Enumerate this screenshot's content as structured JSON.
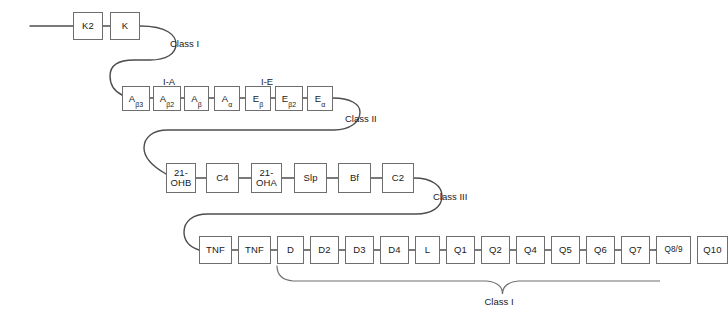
{
  "diagram": {
    "line_color": "#4d4d4d",
    "box_border_color": "#6e6e6e",
    "background": "#ffffff",
    "rows": [
      {
        "id": "row-1",
        "class_label": "Class I",
        "boxes": [
          {
            "id": "k2",
            "label": "K2"
          },
          {
            "id": "k",
            "label": "K"
          }
        ]
      },
      {
        "id": "row-2",
        "class_label": "Class II",
        "group_labels": [
          {
            "id": "i-a",
            "label": "I-A"
          },
          {
            "id": "i-e",
            "label": "I-E"
          }
        ],
        "boxes": [
          {
            "id": "a-beta3",
            "base": "A",
            "sub": "β3"
          },
          {
            "id": "a-beta2",
            "base": "A",
            "sub": "β2"
          },
          {
            "id": "a-beta",
            "base": "A",
            "sub": "β"
          },
          {
            "id": "a-alpha",
            "base": "A",
            "sub": "α"
          },
          {
            "id": "e-beta",
            "base": "E",
            "sub": "β"
          },
          {
            "id": "e-beta2",
            "base": "E",
            "sub": "β2"
          },
          {
            "id": "e-alpha",
            "base": "E",
            "sub": "α"
          }
        ]
      },
      {
        "id": "row-3",
        "class_label": "Class III",
        "boxes": [
          {
            "id": "21-ohb",
            "label": "21-\nOHB"
          },
          {
            "id": "c4",
            "label": "C4"
          },
          {
            "id": "21-oha",
            "label": "21-\nOHA"
          },
          {
            "id": "slp",
            "label": "Slp"
          },
          {
            "id": "bf",
            "label": "Bf"
          },
          {
            "id": "c2",
            "label": "C2"
          }
        ]
      },
      {
        "id": "row-4",
        "brace_label": "Class I",
        "boxes": [
          {
            "id": "tnf-1",
            "label": "TNF"
          },
          {
            "id": "tnf-2",
            "label": "TNF"
          },
          {
            "id": "d",
            "label": "D"
          },
          {
            "id": "d2",
            "label": "D2"
          },
          {
            "id": "d3",
            "label": "D3"
          },
          {
            "id": "d4",
            "label": "D4"
          },
          {
            "id": "l",
            "label": "L"
          },
          {
            "id": "q1",
            "label": "Q1"
          },
          {
            "id": "q2",
            "label": "Q2"
          },
          {
            "id": "q4",
            "label": "Q4"
          },
          {
            "id": "q5",
            "label": "Q5"
          },
          {
            "id": "q6",
            "label": "Q6"
          },
          {
            "id": "q7",
            "label": "Q7"
          },
          {
            "id": "q8-9",
            "label": "Q8/9"
          },
          {
            "id": "q10",
            "label": "Q10"
          }
        ]
      }
    ]
  }
}
